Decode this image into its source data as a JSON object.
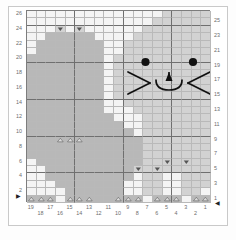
{
  "chart": {
    "type": "knitting-chart",
    "columns": 19,
    "rows": 26,
    "palette": {
      "background": "#efefef",
      "light": "#f4f4f4",
      "mid": "#d2d2d2",
      "dark": "#b8b8b8",
      "grid_minor": "#b9b9b9",
      "grid_major": "#6f6f6f",
      "symbol_dark": "#555555",
      "symbol_light": "#dcdcdc",
      "ink": "#111111"
    },
    "legend_keys": [
      "light",
      "mid",
      "dark"
    ],
    "row_labels_left": [
      26,
      24,
      22,
      20,
      18,
      16,
      14,
      12,
      10,
      8,
      6,
      4,
      2
    ],
    "row_labels_right": [
      25,
      23,
      21,
      19,
      17,
      15,
      13,
      11,
      9,
      7,
      5,
      3,
      1
    ],
    "col_labels_odd": [
      19,
      17,
      15,
      13,
      11,
      9,
      7,
      5,
      3,
      1
    ],
    "col_labels_even": [
      18,
      16,
      14,
      12,
      10,
      8,
      6,
      4,
      2
    ],
    "start_marker_left_row": 2,
    "start_marker_right_row": 1,
    "cells": [
      "LLLLLLLLLLLLLLMMMMM",
      "LLLLLLLLLLLLLMMMMMM",
      "LLLVLVLLLLLLMMMMMMM",
      "LLDDDDDLLLLMMMMMMMM",
      "LDDDDDDDLLMMMMMMMMM",
      "LDDDDDDDLLMMMMMMMMM",
      "DDDDDDDDLMMMMMMMMMM",
      "DDDDDDDDLMMMMMMMMMM",
      "DDDDDDDDLMMMMMMMMMM",
      "DDDDDDDDLMMMMMMMMMM",
      "DDDDDDDDLMMMMMMMMMM",
      "DDDDDDDDLMMMMMMMMMM",
      "DDDDDDDDLLMMMMMMMMM",
      "DDDDDDDDLLLMMMMMMMM",
      "DDDDDDDDDLLLMMMMMMM",
      "DDDDDDDDDDLLMMMMMMM",
      "DDDDDDDDDDDLMMMMMMM",
      "DDDAAADDDDDDMMMMMMM",
      "DDDDDDDDDDDDMMMMMMM",
      "DDDDDDDDDDDDMMMMMMM",
      "LDDDDDDDDDDDMMVMVMM",
      "LLDDDDDDDDDVMVMMMMM",
      "LLDDDDDDDDDLMMLLMMM",
      "LLLDDDDDDDLLMMLLMMM",
      "LLLLDDDDDDLLMMLLMML",
      "AAALAAADDAAALAAALAAL"
    ],
    "symbols": {
      "V": "dark-triangle-down",
      "A": "light-triangle-up"
    },
    "face": {
      "left_eye": {
        "col": 14,
        "row": 21
      },
      "right_eye": {
        "col": 4,
        "row": 21
      },
      "nose": {
        "col": 9,
        "row": 19
      },
      "whisker_left": "left-whisker-chevron",
      "whisker_right": "right-whisker-chevron"
    }
  }
}
